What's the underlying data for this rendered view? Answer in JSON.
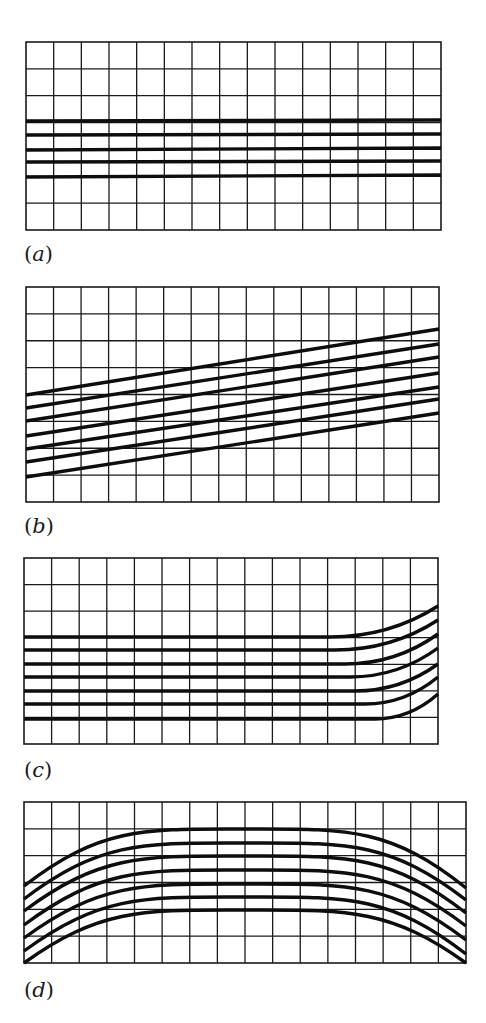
{
  "figure": {
    "background": "#ffffff",
    "line_color": "#1a1a1a",
    "panels": [
      {
        "id": "a",
        "label_open": "(",
        "label_letter": "a",
        "label_close": ")",
        "label_pos": [
          24,
          244
        ],
        "grid": {
          "x0": 26,
          "y0": 42,
          "x1": 441,
          "y1": 230,
          "cols": 15,
          "rows": 7
        },
        "curve_type": "horizontal-straight",
        "lines": [
          {
            "points": [
              [
                26,
                121
              ],
              [
                441,
                120
              ]
            ]
          },
          {
            "points": [
              [
                26,
                135
              ],
              [
                441,
                134
              ]
            ]
          },
          {
            "points": [
              [
                26,
                150
              ],
              [
                441,
                148
              ]
            ]
          },
          {
            "points": [
              [
                26,
                162
              ],
              [
                441,
                161
              ]
            ]
          },
          {
            "points": [
              [
                26,
                177
              ],
              [
                441,
                175
              ]
            ]
          }
        ]
      },
      {
        "id": "b",
        "label_open": "(",
        "label_letter": "b",
        "label_close": ")",
        "label_pos": [
          24,
          516
        ],
        "grid": {
          "x0": 26,
          "y0": 287,
          "x1": 439,
          "y1": 502,
          "cols": 15,
          "rows": 8
        },
        "curve_type": "sloped-straight",
        "lines": [
          {
            "points": [
              [
                26,
                395
              ],
              [
                439,
                329
              ]
            ]
          },
          {
            "points": [
              [
                26,
                408
              ],
              [
                439,
                344
              ]
            ]
          },
          {
            "points": [
              [
                26,
                421
              ],
              [
                439,
                357
              ]
            ]
          },
          {
            "points": [
              [
                26,
                436
              ],
              [
                439,
                373
              ]
            ]
          },
          {
            "points": [
              [
                26,
                449
              ],
              [
                439,
                387
              ]
            ]
          },
          {
            "points": [
              [
                26,
                462
              ],
              [
                439,
                399
              ]
            ]
          },
          {
            "points": [
              [
                26,
                477
              ],
              [
                439,
                413
              ]
            ]
          }
        ]
      },
      {
        "id": "c",
        "label_open": "(",
        "label_letter": "c",
        "label_close": ")",
        "label_pos": [
          24,
          760
        ],
        "grid": {
          "x0": 24,
          "y0": 558,
          "x1": 438,
          "y1": 744,
          "cols": 15,
          "rows": 7
        },
        "curve_type": "flat-then-curving-up",
        "lines": [
          {
            "flat_y": 637,
            "bend_x": 330,
            "end_y": 606
          },
          {
            "flat_y": 650,
            "bend_x": 335,
            "end_y": 620
          },
          {
            "flat_y": 664,
            "bend_x": 345,
            "end_y": 634
          },
          {
            "flat_y": 677,
            "bend_x": 350,
            "end_y": 648
          },
          {
            "flat_y": 691,
            "bend_x": 355,
            "end_y": 664
          },
          {
            "flat_y": 704,
            "bend_x": 365,
            "end_y": 677
          },
          {
            "flat_y": 719,
            "bend_x": 375,
            "end_y": 694
          }
        ]
      },
      {
        "id": "d",
        "label_open": "(",
        "label_letter": "d",
        "label_close": ")",
        "label_pos": [
          24,
          980
        ],
        "grid": {
          "x0": 24,
          "y0": 802,
          "x1": 466,
          "y1": 963,
          "cols": 16,
          "rows": 6
        },
        "curve_type": "arch",
        "lines": [
          {
            "left_y": 886,
            "peak_y": 829,
            "right_y": 888
          },
          {
            "left_y": 899,
            "peak_y": 843,
            "right_y": 900
          },
          {
            "left_y": 911,
            "peak_y": 856,
            "right_y": 913
          },
          {
            "left_y": 925,
            "peak_y": 870,
            "right_y": 926
          },
          {
            "left_y": 938,
            "peak_y": 884,
            "right_y": 940
          },
          {
            "left_y": 951,
            "peak_y": 897,
            "right_y": 954
          },
          {
            "left_y": 963,
            "peak_y": 910,
            "right_y": 963
          }
        ],
        "peak_x": 245
      }
    ]
  }
}
